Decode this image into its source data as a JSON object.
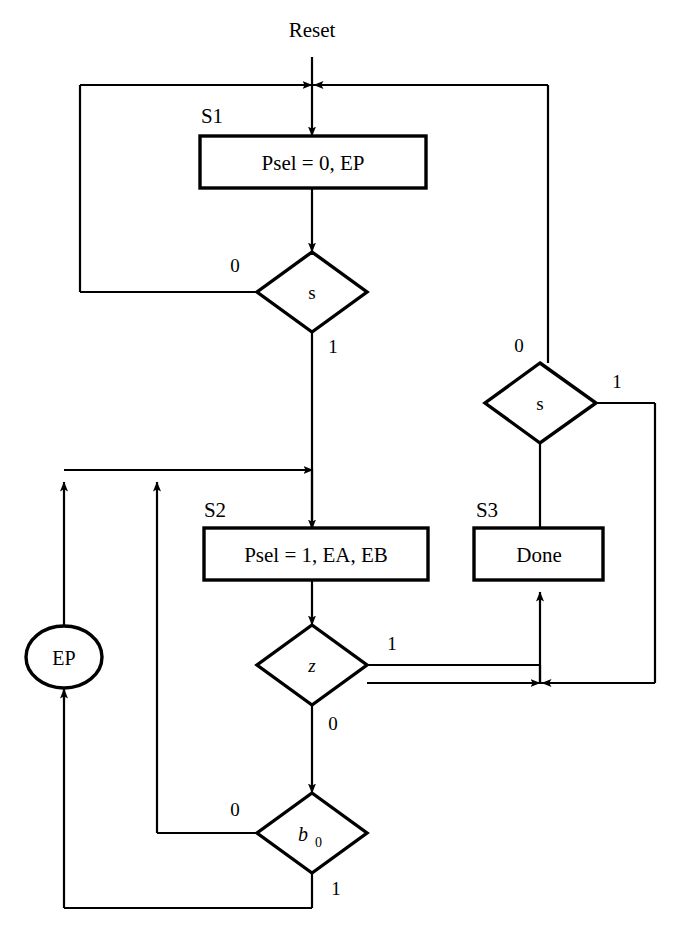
{
  "diagram": {
    "type": "asm-flowchart",
    "title_text": "Reset",
    "states": [
      {
        "id": "S1",
        "name_label": "S1",
        "shape": "rectangle",
        "text": "Psel = 0, EP"
      },
      {
        "id": "S2",
        "name_label": "S2",
        "shape": "rectangle",
        "text": "Psel = 1, EA, EB"
      },
      {
        "id": "S3",
        "name_label": "S3",
        "shape": "rectangle",
        "text": "Done"
      }
    ],
    "decisions": [
      {
        "id": "D1",
        "text": "s",
        "italic": false,
        "branch_left": "0",
        "branch_bottom": "1"
      },
      {
        "id": "D2",
        "text": "s",
        "italic": false,
        "branch_top": "0",
        "branch_right": "1"
      },
      {
        "id": "D3",
        "text": "z",
        "italic": true,
        "branch_right": "1",
        "branch_bottom": "0"
      },
      {
        "id": "D4",
        "text": "b",
        "subscript": "0",
        "italic": true,
        "branch_left": "0",
        "branch_bottom": "1"
      }
    ],
    "outputs": [
      {
        "id": "O1",
        "shape": "oval",
        "text": "EP"
      }
    ],
    "branch_labels": {
      "d1_zero": "0",
      "d1_one": "1",
      "d2_zero": "0",
      "d2_one": "1",
      "d3_one": "1",
      "d3_zero": "0",
      "d4_zero": "0",
      "d4_one": "1"
    },
    "colors": {
      "line": "#000000",
      "background": "#ffffff",
      "text": "#000000"
    }
  }
}
